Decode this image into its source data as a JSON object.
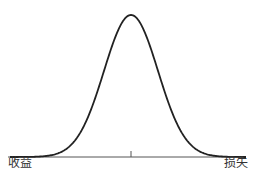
{
  "chart_data": {
    "type": "line",
    "title": "",
    "xlabel": "",
    "ylabel": "",
    "x_axis_labels": {
      "left": "收益",
      "right": "损失"
    },
    "series": [
      {
        "name": "distribution",
        "shape": "bell-curve (normal density)",
        "center": 0
      }
    ],
    "annotations": [
      "center tick mark at mean"
    ],
    "grid": false,
    "legend": null
  },
  "labels": {
    "left": "收益",
    "right": "损失"
  },
  "colors": {
    "curve": "#222222",
    "axis": "#555555",
    "text": "#333333"
  }
}
